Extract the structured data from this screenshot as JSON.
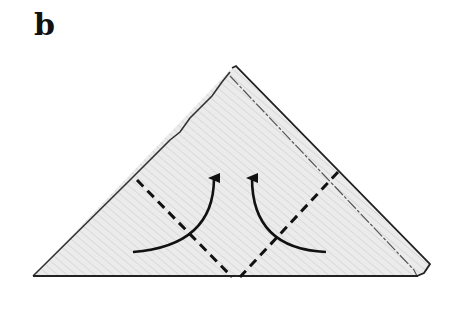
{
  "panel": {
    "label": "b",
    "description": "Folded triangle with two corners folded up along dashed lines"
  },
  "diagram": {
    "shape": "triangle",
    "fill_color": "#e4e4e4",
    "stroke_color": "#222222",
    "fold_lines": [
      {
        "name": "left-fold",
        "style": "dashed"
      },
      {
        "name": "right-fold",
        "style": "dashed"
      }
    ],
    "arrows": [
      {
        "name": "left-corner-up",
        "direction": "up"
      },
      {
        "name": "right-corner-up",
        "direction": "up"
      }
    ]
  }
}
